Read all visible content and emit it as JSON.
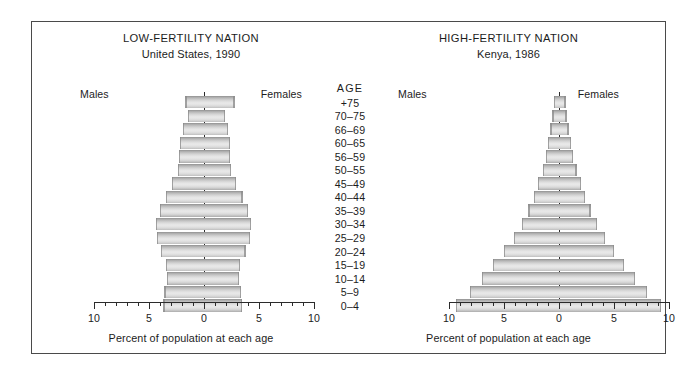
{
  "figure": {
    "age_column_heading": "AGE",
    "axis_title": "Percent of population at each age",
    "males_label": "Males",
    "females_label": "Females",
    "border_color": "#4a4a4a",
    "bar_color": "#d8d8d8",
    "axis_color": "#2b2b2b"
  },
  "chart_data": {
    "type": "bar",
    "subtype": "population-pyramid",
    "xlabel": "Percent of population at each age",
    "ylabel": "AGE",
    "xlim": [
      -10,
      10
    ],
    "xticks_major": [
      10,
      5,
      0,
      5,
      10
    ],
    "xtick_minor_step": 1,
    "grid": false,
    "legend": [
      "Males",
      "Females"
    ],
    "categories": [
      "0–4",
      "5–9",
      "10–14",
      "15–19",
      "20–24",
      "25–29",
      "30–34",
      "35–39",
      "40–44",
      "45–49",
      "50–55",
      "56–59",
      "60–65",
      "66–69",
      "70–75",
      "+75"
    ],
    "panels": [
      {
        "id": "low-fertility",
        "heading": "LOW-FERTILITY NATION",
        "subheading": "United States, 1990",
        "series": [
          {
            "name": "Males",
            "values": [
              3.7,
              3.6,
              3.4,
              3.5,
              3.9,
              4.3,
              4.4,
              4.0,
              3.5,
              2.9,
              2.4,
              2.3,
              2.2,
              1.9,
              1.5,
              1.7
            ]
          },
          {
            "name": "Females",
            "values": [
              3.5,
              3.4,
              3.2,
              3.3,
              3.8,
              4.2,
              4.3,
              4.0,
              3.5,
              2.9,
              2.5,
              2.4,
              2.4,
              2.2,
              1.9,
              2.8
            ]
          }
        ]
      },
      {
        "id": "high-fertility",
        "heading": "HIGH-FERTILITY NATION",
        "subheading": "Kenya, 1986",
        "series": [
          {
            "name": "Males",
            "values": [
              9.4,
              8.1,
              7.0,
              6.0,
              5.0,
              4.1,
              3.4,
              2.8,
              2.3,
              1.9,
              1.5,
              1.2,
              1.0,
              0.8,
              0.6,
              0.5
            ]
          },
          {
            "name": "Females",
            "values": [
              9.3,
              8.0,
              6.9,
              5.9,
              5.0,
              4.2,
              3.5,
              2.9,
              2.4,
              2.0,
              1.6,
              1.3,
              1.1,
              0.9,
              0.7,
              0.6
            ]
          }
        ]
      }
    ]
  }
}
